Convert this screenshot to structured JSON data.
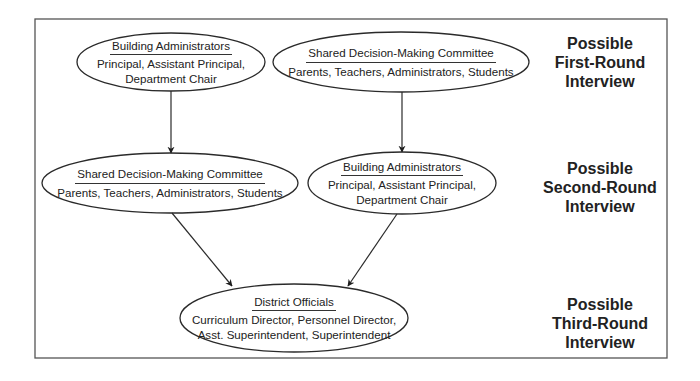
{
  "diagram": {
    "frame": {
      "x": 35,
      "y": 19,
      "width": 632,
      "height": 339,
      "stroke": "#555555"
    },
    "nodes": [
      {
        "id": "r1-building-admins",
        "title": "Building Administrators",
        "members": "Principal, Assistant Principal, Department Chair",
        "member_lines": [
          "Principal, Assistant Principal,",
          "Department Chair"
        ],
        "cx": 171,
        "cy": 62,
        "rx": 94,
        "ry": 29
      },
      {
        "id": "r1-shared-committee",
        "title": "Shared Decision-Making Committee",
        "members": "Parents, Teachers, Administrators, Students",
        "member_lines": [
          "Parents, Teachers, Administrators, Students"
        ],
        "cx": 401,
        "cy": 62,
        "rx": 128,
        "ry": 30
      },
      {
        "id": "r2-shared-committee",
        "title": "Shared Decision-Making Committee",
        "members": "Parents, Teachers, Administrators, Students",
        "member_lines": [
          "Parents, Teachers, Administrators, Students"
        ],
        "cx": 170,
        "cy": 183,
        "rx": 128,
        "ry": 30
      },
      {
        "id": "r2-building-admins",
        "title": "Building Administrators",
        "members": "Principal, Assistant Principal, Department Chair",
        "member_lines": [
          "Principal, Assistant Principal,",
          "Department Chair"
        ],
        "cx": 402,
        "cy": 183,
        "rx": 94,
        "ry": 31
      },
      {
        "id": "r3-district-officials",
        "title": "District Officials",
        "members": "Curriculum Director, Personnel Director, Asst. Superintendent, Superintendent",
        "member_lines": [
          "Curriculum Director, Personnel Director,",
          "Asst. Superintendent, Superintendent"
        ],
        "cx": 294,
        "cy": 318,
        "rx": 114,
        "ry": 34
      }
    ],
    "edges": [
      {
        "from": "r1-building-admins",
        "to": "r2-shared-committee",
        "x1": 171,
        "y1": 91,
        "x2": 171,
        "y2": 153
      },
      {
        "from": "r1-shared-committee",
        "to": "r2-building-admins",
        "x1": 402,
        "y1": 92,
        "x2": 402,
        "y2": 152
      },
      {
        "from": "r2-shared-committee",
        "to": "r3-district-officials",
        "x1": 172,
        "y1": 213,
        "x2": 232,
        "y2": 286
      },
      {
        "from": "r2-building-admins",
        "to": "r3-district-officials",
        "x1": 397,
        "y1": 214,
        "x2": 348,
        "y2": 286
      }
    ],
    "rounds": [
      {
        "label": "Possible First-Round Interview",
        "lines": [
          "Possible",
          "First-Round",
          "Interview"
        ],
        "cx": 600,
        "top": 34
      },
      {
        "label": "Possible Second-Round Interview",
        "lines": [
          "Possible",
          "Second-Round",
          "Interview"
        ],
        "cx": 600,
        "top": 159
      },
      {
        "label": "Possible Third-Round Interview",
        "lines": [
          "Possible",
          "Third-Round",
          "Interview"
        ],
        "cx": 600,
        "top": 295
      }
    ],
    "colors": {
      "stroke": "#2a2a2a",
      "text": "#222222",
      "background": "#ffffff"
    }
  }
}
